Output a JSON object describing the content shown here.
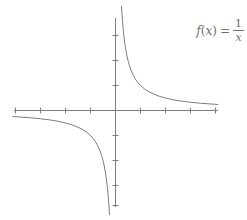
{
  "figure": {
    "background_color": "#ffffff",
    "line_color": "#7d7d7d",
    "text_color": "#6f6f6f",
    "width": 247,
    "height": 220
  },
  "label": {
    "name": "function-label",
    "full_text": "f(x) = 1/x",
    "function_name": "f",
    "open_paren": "(",
    "variable": "x",
    "close_paren": ")",
    "equals": "=",
    "numerator": "1",
    "denominator": "x"
  },
  "chart_data": {
    "type": "line",
    "title": "",
    "subtitle": "",
    "xlabel": "",
    "ylabel": "",
    "legend": [],
    "legend_position": "none",
    "grid": false,
    "annotations": [
      {
        "text": "f(x) = 1/x",
        "x": 4.1,
        "y": 3.7
      }
    ],
    "axes": {
      "x_axis_visible": true,
      "y_axis_visible": true,
      "x_tick_labels": [],
      "y_tick_labels": [],
      "x_ticks": [
        -4,
        -3,
        -2,
        -1,
        1,
        2,
        3,
        4
      ],
      "y_ticks": [
        -4,
        -3,
        -2,
        -1,
        1,
        2,
        3,
        4
      ],
      "xlim": [
        -4.5,
        4.5
      ],
      "ylim": [
        -4.5,
        4.5
      ],
      "origin_px": {
        "x": 115,
        "y": 110
      },
      "unit_px": 25,
      "x_axis_start_px": 14,
      "x_axis_end_px": 218,
      "y_axis_start_px": 18,
      "y_axis_end_px": 207,
      "tick_half_length_px": 3
    },
    "series": [
      {
        "name": "f(x) = 1/x (right branch)",
        "equation": "y = 1/x",
        "domain": [
          0.24,
          4.1
        ],
        "x": [
          0.24,
          0.26,
          0.28,
          0.3,
          0.33,
          0.36,
          0.4,
          0.45,
          0.5,
          0.56,
          0.63,
          0.71,
          0.8,
          0.9,
          1.0,
          1.15,
          1.3,
          1.5,
          1.75,
          2.0,
          2.3,
          2.6,
          3.0,
          3.4,
          3.7,
          4.1
        ],
        "y": [
          4.17,
          3.85,
          3.57,
          3.33,
          3.03,
          2.78,
          2.5,
          2.22,
          2.0,
          1.79,
          1.59,
          1.41,
          1.25,
          1.11,
          1.0,
          0.87,
          0.77,
          0.67,
          0.57,
          0.5,
          0.43,
          0.38,
          0.33,
          0.29,
          0.27,
          0.24
        ]
      },
      {
        "name": "f(x) = 1/x (left branch)",
        "equation": "y = 1/x",
        "domain": [
          -4.1,
          -0.24
        ],
        "x": [
          -4.1,
          -3.7,
          -3.4,
          -3.0,
          -2.6,
          -2.3,
          -2.0,
          -1.75,
          -1.5,
          -1.3,
          -1.15,
          -1.0,
          -0.9,
          -0.8,
          -0.71,
          -0.63,
          -0.56,
          -0.5,
          -0.45,
          -0.4,
          -0.36,
          -0.33,
          -0.3,
          -0.28,
          -0.26,
          -0.24
        ],
        "y": [
          -0.24,
          -0.27,
          -0.29,
          -0.33,
          -0.38,
          -0.43,
          -0.5,
          -0.57,
          -0.67,
          -0.77,
          -0.87,
          -1.0,
          -1.11,
          -1.25,
          -1.41,
          -1.59,
          -1.79,
          -2.0,
          -2.22,
          -2.5,
          -2.78,
          -3.03,
          -3.33,
          -3.57,
          -3.85,
          -4.17
        ]
      }
    ],
    "asymptotes": [
      {
        "type": "vertical",
        "value": 0
      },
      {
        "type": "horizontal",
        "value": 0
      }
    ]
  }
}
